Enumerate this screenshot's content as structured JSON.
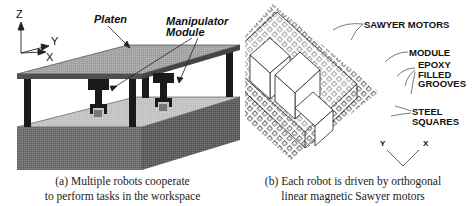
{
  "figure": {
    "panel_a": {
      "axes": {
        "z": "Z",
        "y": "Y",
        "x": "X"
      },
      "labels": {
        "platen": "Platen",
        "manipulator_line1": "Manipulator",
        "manipulator_line2": "Module"
      },
      "caption_line1": "(a) Multiple robots cooperate",
      "caption_line2": "to perform tasks in the workspace"
    },
    "panel_b": {
      "labels": {
        "sawyer_motors": "SAWYER MOTORS",
        "module": "MODULE",
        "epoxy_line1": "EPOXY",
        "epoxy_line2": "FILLED",
        "epoxy_line3": "GROOVES",
        "steel_line1": "STEEL",
        "steel_line2": "SQUARES"
      },
      "axes": {
        "y": "Y",
        "x": "X"
      },
      "caption_line1": "(b) Each robot is driven by orthogonal",
      "caption_line2": "linear magnetic Sawyer motors"
    },
    "colors": {
      "platen_top": "#a8a8a8",
      "platen_edge": "#555555",
      "legs": "#1a1a1a",
      "base_front": "#6e6e6e",
      "base_side": "#5c5c5c",
      "workspace_top": "#c4c4c4"
    }
  }
}
